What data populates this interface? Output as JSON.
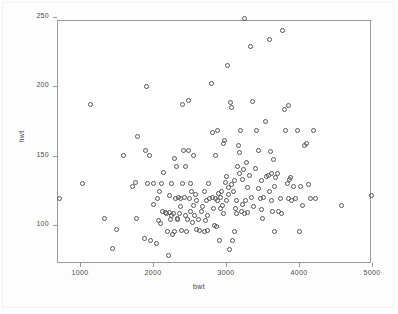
{
  "chart_data": {
    "type": "scatter",
    "title": "",
    "xlabel": "bwt",
    "ylabel": "hwt",
    "xlim": [
      700,
      5050
    ],
    "ylim": [
      75,
      252
    ],
    "xticks": [
      1000,
      2000,
      3000,
      4000,
      5000
    ],
    "yticks": [
      100,
      150,
      200,
      250
    ],
    "xticklabels": [
      "1000",
      "2000",
      "3000",
      "4000",
      "5000"
    ],
    "yticklabels": [
      "100",
      "150",
      "200",
      "250"
    ],
    "grid": false,
    "legend": null,
    "marker": "open-circle",
    "marker_color": "#555555",
    "frame_color": "#9a9a9a",
    "background": "#ffffff",
    "n_points": 183,
    "points": [
      [
        720,
        119
      ],
      [
        1030,
        130
      ],
      [
        1150,
        187
      ],
      [
        1330,
        105
      ],
      [
        1450,
        83
      ],
      [
        1500,
        97
      ],
      [
        1590,
        150
      ],
      [
        1720,
        128
      ],
      [
        1760,
        131
      ],
      [
        1780,
        105
      ],
      [
        1790,
        164
      ],
      [
        1890,
        90
      ],
      [
        1900,
        154
      ],
      [
        1910,
        200
      ],
      [
        1930,
        130
      ],
      [
        1950,
        150
      ],
      [
        1960,
        89
      ],
      [
        2000,
        115
      ],
      [
        2010,
        130
      ],
      [
        2050,
        87
      ],
      [
        2060,
        119
      ],
      [
        2070,
        103
      ],
      [
        2090,
        124
      ],
      [
        2100,
        101
      ],
      [
        2110,
        130
      ],
      [
        2130,
        110
      ],
      [
        2150,
        138
      ],
      [
        2170,
        109
      ],
      [
        2190,
        108
      ],
      [
        2200,
        95
      ],
      [
        2210,
        78
      ],
      [
        2220,
        121
      ],
      [
        2230,
        109
      ],
      [
        2240,
        104
      ],
      [
        2250,
        130
      ],
      [
        2260,
        107
      ],
      [
        2270,
        93
      ],
      [
        2280,
        108
      ],
      [
        2290,
        95
      ],
      [
        2300,
        148
      ],
      [
        2310,
        119
      ],
      [
        2320,
        142
      ],
      [
        2330,
        105
      ],
      [
        2340,
        104
      ],
      [
        2350,
        120
      ],
      [
        2360,
        108
      ],
      [
        2370,
        119
      ],
      [
        2380,
        113
      ],
      [
        2390,
        96
      ],
      [
        2400,
        130
      ],
      [
        2410,
        187
      ],
      [
        2420,
        154
      ],
      [
        2430,
        120
      ],
      [
        2440,
        142
      ],
      [
        2450,
        107
      ],
      [
        2460,
        95
      ],
      [
        2470,
        104
      ],
      [
        2480,
        190
      ],
      [
        2490,
        154
      ],
      [
        2500,
        119
      ],
      [
        2510,
        130
      ],
      [
        2520,
        110
      ],
      [
        2530,
        124
      ],
      [
        2540,
        102
      ],
      [
        2550,
        114
      ],
      [
        2560,
        150
      ],
      [
        2570,
        107
      ],
      [
        2580,
        122
      ],
      [
        2590,
        97
      ],
      [
        2600,
        118
      ],
      [
        2620,
        104
      ],
      [
        2640,
        96
      ],
      [
        2660,
        110
      ],
      [
        2680,
        113
      ],
      [
        2700,
        95
      ],
      [
        2710,
        124
      ],
      [
        2720,
        103
      ],
      [
        2730,
        118
      ],
      [
        2740,
        96
      ],
      [
        2750,
        107
      ],
      [
        2760,
        130
      ],
      [
        2780,
        119
      ],
      [
        2800,
        202
      ],
      [
        2810,
        167
      ],
      [
        2820,
        120
      ],
      [
        2830,
        112
      ],
      [
        2840,
        100
      ],
      [
        2850,
        150
      ],
      [
        2860,
        119
      ],
      [
        2870,
        99
      ],
      [
        2880,
        168
      ],
      [
        2890,
        118
      ],
      [
        2900,
        123
      ],
      [
        2910,
        89
      ],
      [
        2920,
        120
      ],
      [
        2930,
        112
      ],
      [
        2940,
        124
      ],
      [
        2950,
        114
      ],
      [
        2960,
        159
      ],
      [
        2970,
        108
      ],
      [
        2980,
        161
      ],
      [
        2990,
        131
      ],
      [
        3000,
        118
      ],
      [
        3010,
        135
      ],
      [
        3020,
        215
      ],
      [
        3030,
        127
      ],
      [
        3040,
        122
      ],
      [
        3050,
        82
      ],
      [
        3060,
        188
      ],
      [
        3070,
        185
      ],
      [
        3080,
        129
      ],
      [
        3090,
        89
      ],
      [
        3100,
        124
      ],
      [
        3110,
        132
      ],
      [
        3120,
        95
      ],
      [
        3130,
        112
      ],
      [
        3140,
        118
      ],
      [
        3150,
        108
      ],
      [
        3160,
        142
      ],
      [
        3170,
        157
      ],
      [
        3180,
        152
      ],
      [
        3190,
        137
      ],
      [
        3200,
        168
      ],
      [
        3210,
        110
      ],
      [
        3220,
        133
      ],
      [
        3230,
        115
      ],
      [
        3240,
        140
      ],
      [
        3250,
        108
      ],
      [
        3260,
        249
      ],
      [
        3270,
        118
      ],
      [
        3280,
        145
      ],
      [
        3290,
        127
      ],
      [
        3300,
        109
      ],
      [
        3320,
        136
      ],
      [
        3340,
        229
      ],
      [
        3350,
        120
      ],
      [
        3360,
        189
      ],
      [
        3380,
        113
      ],
      [
        3400,
        141
      ],
      [
        3420,
        168
      ],
      [
        3440,
        126
      ],
      [
        3450,
        154
      ],
      [
        3470,
        119
      ],
      [
        3480,
        111
      ],
      [
        3490,
        132
      ],
      [
        3500,
        105
      ],
      [
        3520,
        120
      ],
      [
        3540,
        175
      ],
      [
        3560,
        135
      ],
      [
        3580,
        136
      ],
      [
        3590,
        124
      ],
      [
        3600,
        234
      ],
      [
        3610,
        153
      ],
      [
        3620,
        118
      ],
      [
        3630,
        137
      ],
      [
        3640,
        110
      ],
      [
        3650,
        147
      ],
      [
        3660,
        128
      ],
      [
        3670,
        95
      ],
      [
        3680,
        134
      ],
      [
        3700,
        137
      ],
      [
        3720,
        110
      ],
      [
        3740,
        119
      ],
      [
        3760,
        108
      ],
      [
        3780,
        240
      ],
      [
        3800,
        183
      ],
      [
        3820,
        168
      ],
      [
        3840,
        130
      ],
      [
        3850,
        186
      ],
      [
        3860,
        119
      ],
      [
        3870,
        133
      ],
      [
        3880,
        134
      ],
      [
        3900,
        118
      ],
      [
        3920,
        128
      ],
      [
        3950,
        119
      ],
      [
        3980,
        168
      ],
      [
        4000,
        95
      ],
      [
        4020,
        128
      ],
      [
        4050,
        114
      ],
      [
        4080,
        157
      ],
      [
        4100,
        159
      ],
      [
        4130,
        129
      ],
      [
        4160,
        119
      ],
      [
        4200,
        168
      ],
      [
        4230,
        119
      ],
      [
        4580,
        114
      ],
      [
        4990,
        121
      ]
    ]
  }
}
